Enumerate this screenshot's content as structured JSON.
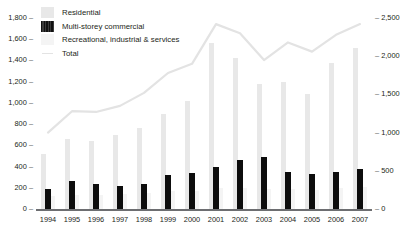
{
  "chart_data": {
    "type": "bar",
    "title": "",
    "subtitle": "",
    "xlabel": "",
    "ylabel": "",
    "categories": [
      "1994",
      "1995",
      "1996",
      "1997",
      "1998",
      "1999",
      "2000",
      "2001",
      "2002",
      "2003",
      "2004",
      "2005",
      "2006",
      "2007"
    ],
    "legend": {
      "position": "top-left",
      "entries": [
        "Residential",
        "Multi-storey commercial",
        "Recreational, industrial & services",
        "Total"
      ]
    },
    "grid": false,
    "left_axis": {
      "label": "",
      "ticks": [
        "0",
        "200",
        "400",
        "600",
        "800",
        "1,000",
        "1,200",
        "1,400",
        "1,600",
        "1,800"
      ],
      "values": [
        0,
        200,
        400,
        600,
        800,
        1000,
        1200,
        1400,
        1600,
        1800
      ],
      "min": 0,
      "max": 1800
    },
    "right_axis": {
      "label": "",
      "ticks": [
        "0",
        "500",
        "1,000",
        "1,500",
        "2,000",
        "2,500"
      ],
      "values": [
        0,
        500,
        1000,
        1500,
        2000,
        2500
      ],
      "min": 0,
      "max": 2500
    },
    "series": [
      {
        "name": "Residential",
        "axis": "left",
        "kind": "bar",
        "color": "#e8e8e8",
        "values": [
          520,
          660,
          640,
          700,
          760,
          900,
          1020,
          1560,
          1420,
          1180,
          1200,
          1080,
          1380,
          1520
        ]
      },
      {
        "name": "Multi-storey commercial",
        "axis": "left",
        "kind": "bar",
        "color": "#0d0d0d",
        "values": [
          190,
          260,
          240,
          220,
          240,
          320,
          340,
          400,
          460,
          490,
          350,
          330,
          350,
          380
        ]
      },
      {
        "name": "Recreational, industrial & services",
        "axis": "left",
        "kind": "bar",
        "color": "#f4f4f4",
        "values": [
          120,
          130,
          130,
          140,
          150,
          170,
          170,
          200,
          200,
          190,
          190,
          180,
          200,
          210
        ]
      },
      {
        "name": "Total",
        "axis": "right",
        "kind": "line",
        "color": "#e3e3e3",
        "values": [
          1000,
          1280,
          1270,
          1350,
          1520,
          1780,
          1900,
          2420,
          2300,
          1950,
          2180,
          2060,
          2280,
          2420
        ]
      }
    ]
  }
}
